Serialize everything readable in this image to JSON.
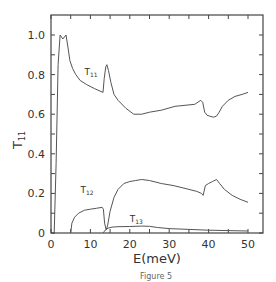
{
  "chart_data": {
    "type": "line",
    "title": "",
    "xlabel": "E(meV)",
    "ylabel": "T",
    "ylabel_sub": "11",
    "xlim": [
      0,
      54
    ],
    "ylim": [
      0,
      1.1
    ],
    "xticks": [
      0,
      10,
      20,
      30,
      40,
      50
    ],
    "yticks": [
      0,
      0.2,
      0.4,
      0.6,
      0.8,
      1.0
    ],
    "xtick_labels": [
      "0",
      "10",
      "20",
      "30",
      "40",
      "50"
    ],
    "ytick_labels": [
      "0",
      "0.2",
      "0.4",
      "0.6",
      "0.8",
      "1.0"
    ],
    "grid": false,
    "legend": "inline labels",
    "series": [
      {
        "name": "T11",
        "label_main": "T",
        "label_sub": "11",
        "label_pos": [
          8.5,
          0.8
        ],
        "x": [
          0,
          0.8,
          1.3,
          1.8,
          2.3,
          3.0,
          3.8,
          4.3,
          4.8,
          5.5,
          6.3,
          7.4,
          9,
          11,
          13.2,
          13.5,
          13.9,
          14.2,
          14.6,
          15.2,
          16,
          17,
          19,
          21,
          23,
          25,
          28,
          31.5,
          34,
          36.5,
          38,
          38.5,
          39,
          39.6,
          40.3,
          41.2,
          42,
          42.7,
          43.5,
          45,
          46.7,
          48.5,
          50
        ],
        "values": [
          0,
          0,
          0.35,
          0.85,
          1.0,
          0.98,
          1.0,
          0.94,
          0.87,
          0.83,
          0.8,
          0.77,
          0.75,
          0.73,
          0.71,
          0.78,
          0.84,
          0.85,
          0.82,
          0.76,
          0.7,
          0.67,
          0.63,
          0.6,
          0.6,
          0.61,
          0.62,
          0.64,
          0.645,
          0.65,
          0.67,
          0.66,
          0.61,
          0.595,
          0.59,
          0.585,
          0.59,
          0.61,
          0.64,
          0.67,
          0.69,
          0.7,
          0.71
        ]
      },
      {
        "name": "T12",
        "label_main": "T",
        "label_sub": "12",
        "label_pos": [
          7.5,
          0.2
        ],
        "x": [
          5,
          5.3,
          6,
          7,
          8.5,
          10,
          11.5,
          13,
          13.3,
          13.6,
          14,
          14.4,
          15,
          16,
          17,
          18.5,
          20,
          21.5,
          23,
          25,
          28,
          31,
          34,
          37,
          38.2,
          38.6,
          39.2,
          40,
          41,
          42,
          42.8,
          44,
          46,
          48,
          50
        ],
        "values": [
          0,
          0.05,
          0.08,
          0.1,
          0.115,
          0.12,
          0.125,
          0.13,
          0.12,
          0.05,
          0.015,
          0.04,
          0.11,
          0.18,
          0.22,
          0.25,
          0.26,
          0.265,
          0.27,
          0.265,
          0.25,
          0.24,
          0.225,
          0.21,
          0.2,
          0.19,
          0.24,
          0.25,
          0.26,
          0.27,
          0.25,
          0.22,
          0.19,
          0.17,
          0.155
        ]
      },
      {
        "name": "T13",
        "label_main": "T",
        "label_sub": "13",
        "label_pos": [
          20,
          0.055
        ],
        "x": [
          13.2,
          13.8,
          14.5,
          15.5,
          17,
          20,
          23,
          25,
          27,
          30,
          35,
          40,
          45,
          50
        ],
        "values": [
          0,
          0.015,
          0.025,
          0.03,
          0.032,
          0.033,
          0.035,
          0.034,
          0.028,
          0.022,
          0.018,
          0.014,
          0.012,
          0.01
        ]
      }
    ],
    "caption": "Figure 5"
  },
  "colors": {
    "line": "#555555",
    "axis": "#444444",
    "background": "#ffffff"
  }
}
